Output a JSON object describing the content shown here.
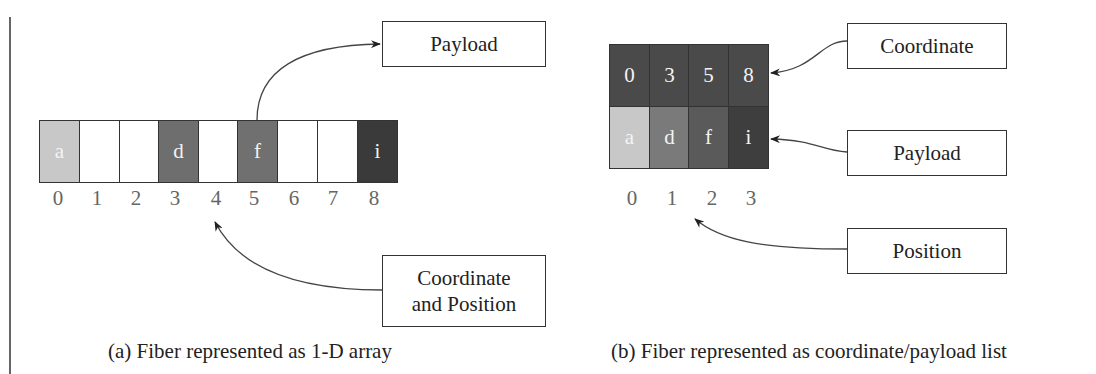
{
  "panel_a": {
    "caption": "(a) Fiber represented as 1-D array",
    "cells": [
      {
        "label": "a",
        "color": "#c8c8c8"
      },
      {
        "label": "",
        "color": "#ffffff"
      },
      {
        "label": "",
        "color": "#ffffff"
      },
      {
        "label": "d",
        "color": "#6e6e6e"
      },
      {
        "label": "",
        "color": "#ffffff"
      },
      {
        "label": "f",
        "color": "#707070"
      },
      {
        "label": "",
        "color": "#ffffff"
      },
      {
        "label": "",
        "color": "#ffffff"
      },
      {
        "label": "i",
        "color": "#3a3a3a"
      }
    ],
    "indices": [
      "0",
      "1",
      "2",
      "3",
      "4",
      "5",
      "6",
      "7",
      "8"
    ],
    "payload_label": "Payload",
    "coord_pos_label_line1": "Coordinate",
    "coord_pos_label_line2": "and Position"
  },
  "panel_b": {
    "caption": "(b) Fiber represented as coordinate/payload list",
    "coordinates": [
      {
        "label": "0",
        "color": "#4a4a4a"
      },
      {
        "label": "3",
        "color": "#4a4a4a"
      },
      {
        "label": "5",
        "color": "#4a4a4a"
      },
      {
        "label": "8",
        "color": "#4a4a4a"
      }
    ],
    "payloads": [
      {
        "label": "a",
        "color": "#c8c8c8"
      },
      {
        "label": "d",
        "color": "#7a7a7a"
      },
      {
        "label": "f",
        "color": "#5a5a5a"
      },
      {
        "label": "i",
        "color": "#3e3e3e"
      }
    ],
    "positions": [
      "0",
      "1",
      "2",
      "3"
    ],
    "coordinate_label": "Coordinate",
    "payload_label": "Payload",
    "position_label": "Position"
  }
}
